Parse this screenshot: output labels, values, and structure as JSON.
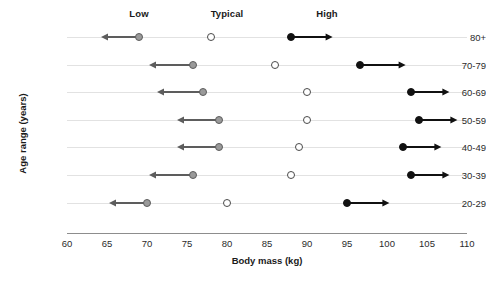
{
  "chart_data": {
    "type": "scatter",
    "title": "",
    "xlabel": "Body mass (kg)",
    "ylabel": "Age range (years)",
    "xlim": [
      60,
      110
    ],
    "xticks": [
      60,
      65,
      70,
      75,
      80,
      85,
      90,
      95,
      100,
      105,
      110
    ],
    "xtick_labels": [
      "60",
      "65",
      "70",
      "75",
      "80",
      "85",
      "90",
      "95",
      "100",
      "105",
      "110"
    ],
    "grid": false,
    "row_guides": true,
    "legend_position": "top",
    "categories": [
      "80+",
      "70-79",
      "60-69",
      "50-59",
      "40-49",
      "30-39",
      "20-29"
    ],
    "column_headers": [
      {
        "label": "Low",
        "x": 69
      },
      {
        "label": "Typical",
        "x": 80
      },
      {
        "label": "High",
        "x": 92.5
      }
    ],
    "series": [
      {
        "name": "Low",
        "marker": "filled-gray-circle",
        "color": "#9a9a9a",
        "edge_color": "#5d5d5d",
        "arrow_direction": "left",
        "values": [
          69,
          75.7,
          77,
          79,
          79,
          75.8,
          70
        ],
        "arrow_ends": [
          64.3,
          70.2,
          71.3,
          73.8,
          73.8,
          70.3,
          65.2
        ]
      },
      {
        "name": "Typical",
        "marker": "open-circle",
        "color": "#ffffff",
        "edge_color": "#4a4a4a",
        "arrow_direction": "none",
        "values": [
          78,
          86,
          90,
          90,
          89,
          88,
          80
        ],
        "arrow_ends": [
          null,
          null,
          null,
          null,
          null,
          null,
          null
        ]
      },
      {
        "name": "High",
        "marker": "filled-black-circle",
        "color": "#111111",
        "edge_color": "#111111",
        "arrow_direction": "right",
        "values": [
          88,
          96.6,
          103,
          104,
          102,
          103,
          95
        ],
        "arrow_ends": [
          93.2,
          102.3,
          107.8,
          108.8,
          106.8,
          107.8,
          100.3
        ]
      }
    ]
  }
}
